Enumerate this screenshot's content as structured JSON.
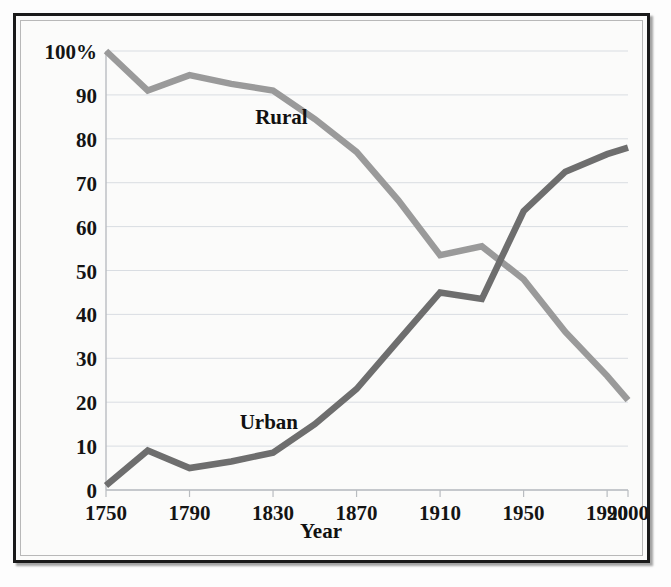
{
  "chart_data": {
    "type": "line",
    "title": "",
    "subtitle": "",
    "xlabel": "Year",
    "ylabel": "",
    "xlim": [
      1750,
      2000
    ],
    "ylim": [
      0,
      100
    ],
    "grid": true,
    "legend_position": "inline-annotation",
    "x": [
      1750,
      1770,
      1790,
      1810,
      1830,
      1850,
      1870,
      1890,
      1910,
      1930,
      1950,
      1970,
      1990,
      2000
    ],
    "xtick_labels": [
      "1750",
      "1790",
      "1830",
      "1870",
      "1910",
      "1950",
      "1990",
      "2000"
    ],
    "xtick_values": [
      1750,
      1790,
      1830,
      1870,
      1910,
      1950,
      1990,
      2000
    ],
    "ytick_labels": [
      "0",
      "10",
      "20",
      "30",
      "40",
      "50",
      "60",
      "70",
      "80",
      "90",
      "100%"
    ],
    "ytick_values": [
      0,
      10,
      20,
      30,
      40,
      50,
      60,
      70,
      80,
      90,
      100
    ],
    "series": [
      {
        "name": "Rural",
        "color": "#9a9a9a",
        "label_text": "Rural",
        "values": [
          100,
          91,
          94.5,
          92.5,
          91,
          84.5,
          77,
          66,
          53.5,
          55.5,
          48,
          36,
          26,
          20.5
        ]
      },
      {
        "name": "Urban",
        "color": "#6e6e6e",
        "label_text": "Urban",
        "values": [
          1,
          9,
          5,
          6.5,
          8.5,
          15,
          23,
          34,
          45,
          43.5,
          63.5,
          72.5,
          76.5,
          78
        ]
      }
    ],
    "annotations": [
      {
        "text": "Rural",
        "x": 1834,
        "y": 85
      },
      {
        "text": "Urban",
        "x": 1828,
        "y": 15.5
      }
    ]
  },
  "figure": {
    "frame_color": "#1a1a1a",
    "background_color": "#fbfbfa",
    "gridline_color": "#d9dde2"
  }
}
